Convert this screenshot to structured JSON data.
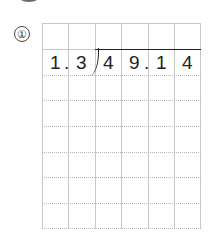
{
  "problem": {
    "number_label": "①",
    "divisor": [
      "1",
      "3"
    ],
    "divisor_decimal_point": ".",
    "dividend": [
      "4",
      "9",
      "1",
      "4"
    ],
    "dividend_decimal_point": ".",
    "grid": {
      "columns": 6,
      "rows": 8
    }
  }
}
